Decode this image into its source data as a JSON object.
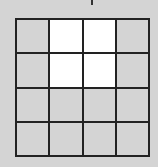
{
  "grid": {
    "rows": 4,
    "cols": 4,
    "colors": {
      "filled": "#ffffff",
      "empty": "#d4d4d4",
      "line": "#222222"
    },
    "cells": [
      [
        0,
        1,
        1,
        0
      ],
      [
        0,
        1,
        1,
        0
      ],
      [
        0,
        0,
        0,
        0
      ],
      [
        0,
        0,
        0,
        0
      ]
    ]
  }
}
